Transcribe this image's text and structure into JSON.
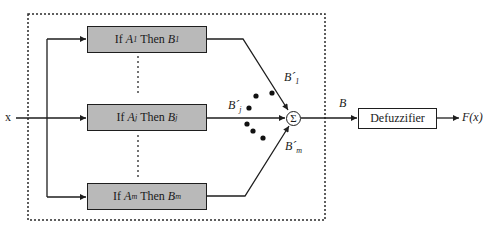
{
  "diagram": {
    "type": "fuzzy-inference-system-block-diagram",
    "input_label": "x",
    "rules": [
      {
        "id": "rule-1",
        "prefix": "If",
        "antecedent": "A",
        "antecedent_sub": "1",
        "connective": "Then",
        "consequent": "B",
        "consequent_sub": "1"
      },
      {
        "id": "rule-j",
        "prefix": "If",
        "antecedent": "A",
        "antecedent_sub": "j",
        "connective": "Then",
        "consequent": "B",
        "consequent_sub": "j"
      },
      {
        "id": "rule-m",
        "prefix": "If",
        "antecedent": "A",
        "antecedent_sub": "m",
        "connective": "Then",
        "consequent": "B",
        "consequent_sub": "m"
      }
    ],
    "rule_outputs": [
      {
        "symbol": "B´",
        "sub": "1"
      },
      {
        "symbol": "B´",
        "sub": "j"
      },
      {
        "symbol": "B´",
        "sub": "m"
      }
    ],
    "aggregator_symbol": "Σ",
    "aggregate_label": "B",
    "defuzzifier_label": "Defuzzifier",
    "output_label": "F(x)",
    "colors": {
      "rule_box_fill": "#b9b9b9",
      "stroke": "#1e1e1e",
      "background": "#ffffff"
    }
  }
}
